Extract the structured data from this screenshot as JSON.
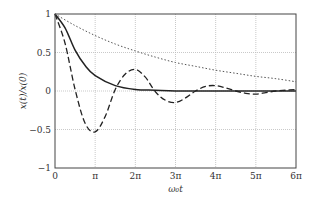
{
  "chart_data": {
    "type": "line",
    "title": "",
    "xlabel": "ω₀t",
    "ylabel": "x(t)/x(0)",
    "xlim": [
      0,
      6
    ],
    "x_unit": "π",
    "ylim": [
      -1,
      1
    ],
    "grid": true,
    "legend": "none",
    "xticks": [
      0,
      1,
      2,
      3,
      4,
      5,
      6
    ],
    "xtick_labels": [
      "0",
      "π",
      "2π",
      "3π",
      "4π",
      "5π",
      "6π"
    ],
    "yticks": [
      -1,
      -0.5,
      0,
      0.5,
      1
    ],
    "ytick_labels": [
      "−1",
      "−0.5",
      "0",
      "0.5",
      "1"
    ],
    "series": [
      {
        "name": "critically damped",
        "style": "solid",
        "x": [
          0,
          0.25,
          0.5,
          0.75,
          1,
          1.5,
          2,
          2.5,
          3,
          4,
          5,
          6
        ],
        "y": [
          1,
          0.82,
          0.53,
          0.33,
          0.2,
          0.07,
          0.02,
          0.01,
          0.0,
          0.0,
          0.0,
          0.0
        ]
      },
      {
        "name": "underdamped",
        "style": "dashed",
        "x": [
          0,
          0.25,
          0.5,
          0.75,
          1,
          1.25,
          1.5,
          1.75,
          2,
          2.25,
          2.5,
          2.75,
          3,
          3.25,
          3.5,
          3.75,
          4,
          4.25,
          4.5,
          4.75,
          5,
          5.25,
          5.5,
          5.75,
          6
        ],
        "y": [
          1,
          0.62,
          0.02,
          -0.42,
          -0.53,
          -0.33,
          0.02,
          0.22,
          0.28,
          0.18,
          -0.01,
          -0.12,
          -0.15,
          -0.09,
          0.0,
          0.06,
          0.07,
          0.04,
          0.0,
          -0.03,
          -0.04,
          -0.02,
          0.0,
          0.01,
          0.02
        ]
      },
      {
        "name": "overdamped",
        "style": "dotted",
        "x": [
          0,
          0.5,
          1,
          1.5,
          2,
          2.5,
          3,
          3.5,
          4,
          4.5,
          5,
          5.5,
          6
        ],
        "y": [
          1,
          0.85,
          0.72,
          0.61,
          0.52,
          0.44,
          0.37,
          0.32,
          0.27,
          0.23,
          0.19,
          0.16,
          0.12
        ]
      }
    ]
  }
}
